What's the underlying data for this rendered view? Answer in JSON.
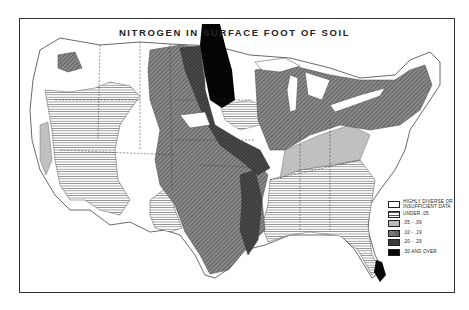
{
  "map": {
    "title": "NITROGEN IN SURFACE FOOT OF SOIL",
    "region": "Contiguous United States",
    "legend": [
      {
        "label_line1": "HIGHLY DIVERSE OR",
        "label_line2": "INSUFFICIENT DATA",
        "pattern": "blank",
        "color": "#ffffff"
      },
      {
        "label_line1": "UNDER .05",
        "label_line2": "",
        "pattern": "horizontal-lines",
        "color": "#e0e0e0"
      },
      {
        "label_line1": ".05 - .09",
        "label_line2": "",
        "pattern": "light-stipple",
        "color": "#bbbbbb"
      },
      {
        "label_line1": ".10 - .19",
        "label_line2": "",
        "pattern": "diagonal-hatch",
        "color": "#777777"
      },
      {
        "label_line1": ".20 - .29",
        "label_line2": "",
        "pattern": "dark-hatch",
        "color": "#3a3a3a"
      },
      {
        "label_line1": ".30 AND OVER",
        "label_line2": "",
        "pattern": "solid-black",
        "color": "#050505"
      }
    ]
  }
}
